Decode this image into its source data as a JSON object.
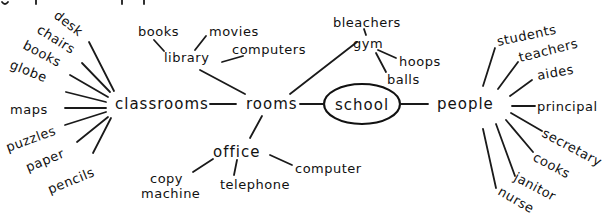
{
  "diagram": {
    "type": "mind-map",
    "center": {
      "label": "school"
    },
    "branches": {
      "rooms": {
        "label": "rooms",
        "children": {
          "classrooms": {
            "label": "classrooms",
            "items": [
              "desk",
              "chairs",
              "books",
              "globe",
              "maps",
              "puzzles",
              "paper",
              "pencils"
            ]
          },
          "library": {
            "label": "library",
            "items": [
              "books",
              "movies",
              "computers"
            ]
          },
          "gym": {
            "label": "gym",
            "items": [
              "bleachers",
              "hoops",
              "balls"
            ]
          },
          "office": {
            "label": "office",
            "items": [
              "copy",
              "machine",
              "telephone",
              "computer"
            ]
          }
        }
      },
      "people": {
        "label": "people",
        "items": [
          "students",
          "teachers",
          "aides",
          "principal",
          "secretary",
          "cooks",
          "janitor",
          "nurse"
        ]
      }
    }
  }
}
